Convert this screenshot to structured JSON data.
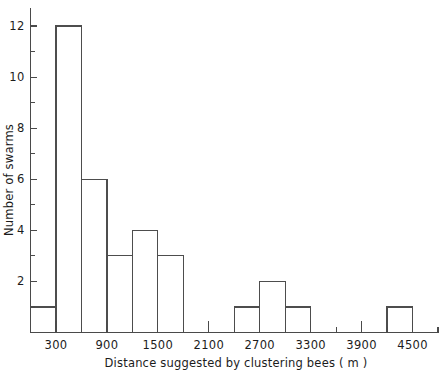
{
  "chart_data": {
    "type": "bar",
    "title": "",
    "subtitle": "",
    "xlabel": "Distance suggested by clustering bees  ( m )",
    "ylabel": "Number of swarms",
    "grid": false,
    "legend": null,
    "bin_width": 300,
    "xlim": [
      0,
      4800
    ],
    "ylim": [
      0,
      12.6
    ],
    "xticks_major": [
      300,
      900,
      1500,
      2100,
      2700,
      3300,
      3900,
      4500
    ],
    "xticks_minor": [
      0,
      600,
      1200,
      1800,
      2400,
      3000,
      3600,
      4200,
      4800
    ],
    "xtick_labels": [
      "300",
      "900",
      "1500",
      "2100",
      "2700",
      "3300",
      "3900",
      "4500"
    ],
    "yticks_major": [
      0,
      2,
      4,
      6,
      8,
      10,
      12
    ],
    "yticks_minor": [
      1,
      3,
      5,
      7,
      9,
      11
    ],
    "ytick_labels": [
      "2",
      "4",
      "6",
      "8",
      "10",
      "12"
    ],
    "bins": [
      {
        "start": 0,
        "end": 300,
        "value": 1
      },
      {
        "start": 300,
        "end": 600,
        "value": 12
      },
      {
        "start": 600,
        "end": 900,
        "value": 6
      },
      {
        "start": 900,
        "end": 1200,
        "value": 3
      },
      {
        "start": 1200,
        "end": 1500,
        "value": 4
      },
      {
        "start": 1500,
        "end": 1800,
        "value": 3
      },
      {
        "start": 1800,
        "end": 2100,
        "value": 0
      },
      {
        "start": 2100,
        "end": 2400,
        "value": 0
      },
      {
        "start": 2400,
        "end": 2700,
        "value": 1
      },
      {
        "start": 2700,
        "end": 3000,
        "value": 2
      },
      {
        "start": 3000,
        "end": 3300,
        "value": 1
      },
      {
        "start": 3300,
        "end": 3600,
        "value": 0
      },
      {
        "start": 3600,
        "end": 3900,
        "value": 0
      },
      {
        "start": 3900,
        "end": 4200,
        "value": 0
      },
      {
        "start": 4200,
        "end": 4500,
        "value": 1
      }
    ],
    "categories": [
      "0-300",
      "300-600",
      "600-900",
      "900-1200",
      "1200-1500",
      "1500-1800",
      "1800-2100",
      "2100-2400",
      "2400-2700",
      "2700-3000",
      "3000-3300",
      "3300-3600",
      "3600-3900",
      "3900-4200",
      "4200-4500"
    ],
    "values": [
      1,
      12,
      6,
      3,
      4,
      3,
      0,
      0,
      1,
      2,
      1,
      0,
      0,
      0,
      1
    ],
    "colors": {
      "bar_stroke": "#4d4d4d",
      "bar_fill": "none",
      "axis": "#4a4a4a",
      "text": "#1c1c1c",
      "background": "#ffffff"
    }
  }
}
